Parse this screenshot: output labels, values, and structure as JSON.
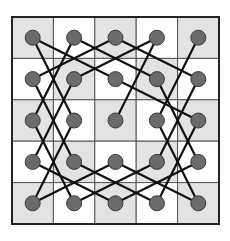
{
  "diagram": {
    "title": "",
    "type": "knight-tour",
    "grid": {
      "rows": 5,
      "cols": 5,
      "left": 12,
      "top": 17,
      "cell": 41.4
    },
    "colors": {
      "shaded": "#e3e3e3",
      "light": "#ffffff",
      "grid_line": "#555555",
      "border": "#222222",
      "node_fill": "#6b6b6b",
      "node_stroke": "#3a3a3a",
      "edge": "#111111"
    },
    "nodes": [
      [
        0,
        0
      ],
      [
        0,
        1
      ],
      [
        0,
        2
      ],
      [
        0,
        3
      ],
      [
        0,
        4
      ],
      [
        1,
        0
      ],
      [
        1,
        1
      ],
      [
        1,
        2
      ],
      [
        1,
        3
      ],
      [
        1,
        4
      ],
      [
        2,
        0
      ],
      [
        2,
        1
      ],
      [
        2,
        2
      ],
      [
        2,
        3
      ],
      [
        2,
        4
      ],
      [
        3,
        0
      ],
      [
        3,
        1
      ],
      [
        3,
        2
      ],
      [
        3,
        3
      ],
      [
        3,
        4
      ],
      [
        4,
        0
      ],
      [
        4,
        1
      ],
      [
        4,
        2
      ],
      [
        4,
        3
      ],
      [
        4,
        4
      ]
    ],
    "edges": [
      [
        [
          0,
          0
        ],
        [
          1,
          2
        ]
      ],
      [
        [
          0,
          0
        ],
        [
          2,
          1
        ]
      ],
      [
        [
          0,
          1
        ],
        [
          2,
          0
        ]
      ],
      [
        [
          0,
          1
        ],
        [
          1,
          3
        ]
      ],
      [
        [
          0,
          2
        ],
        [
          1,
          0
        ]
      ],
      [
        [
          0,
          2
        ],
        [
          1,
          4
        ]
      ],
      [
        [
          0,
          3
        ],
        [
          1,
          1
        ]
      ],
      [
        [
          0,
          3
        ],
        [
          2,
          2
        ]
      ],
      [
        [
          0,
          4
        ],
        [
          2,
          3
        ]
      ],
      [
        [
          1,
          0
        ],
        [
          3,
          1
        ]
      ],
      [
        [
          1,
          1
        ],
        [
          3,
          0
        ]
      ],
      [
        [
          1,
          2
        ],
        [
          2,
          4
        ]
      ],
      [
        [
          1,
          3
        ],
        [
          3,
          4
        ]
      ],
      [
        [
          1,
          4
        ],
        [
          3,
          3
        ]
      ],
      [
        [
          2,
          0
        ],
        [
          4,
          1
        ]
      ],
      [
        [
          2,
          1
        ],
        [
          4,
          0
        ]
      ],
      [
        [
          2,
          3
        ],
        [
          4,
          4
        ]
      ],
      [
        [
          2,
          4
        ],
        [
          4,
          3
        ]
      ],
      [
        [
          3,
          0
        ],
        [
          4,
          2
        ]
      ],
      [
        [
          3,
          1
        ],
        [
          4,
          3
        ]
      ],
      [
        [
          3,
          2
        ],
        [
          4,
          0
        ]
      ],
      [
        [
          3,
          2
        ],
        [
          4,
          4
        ]
      ],
      [
        [
          3,
          3
        ],
        [
          4,
          1
        ]
      ],
      [
        [
          3,
          4
        ],
        [
          4,
          2
        ]
      ]
    ]
  }
}
